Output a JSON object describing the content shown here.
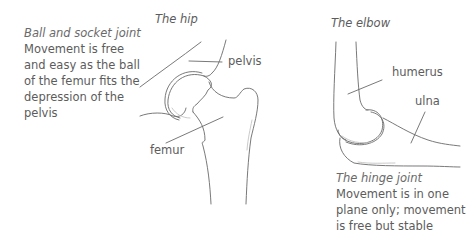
{
  "hip": {
    "title": "The hip",
    "caption_title": "Ball and socket joint",
    "caption_lines": [
      "Movement is free",
      "and easy as the ball",
      "of the femur fits the",
      "depression of the",
      "pelvis"
    ],
    "labels": {
      "pelvis": "pelvis",
      "femur": "femur"
    }
  },
  "elbow": {
    "title": "The elbow",
    "caption_title": "The hinge joint",
    "caption_lines": [
      "Movement is in one",
      "plane only; movement",
      "is free but stable"
    ],
    "labels": {
      "humerus": "humerus",
      "ulna": "ulna"
    }
  }
}
